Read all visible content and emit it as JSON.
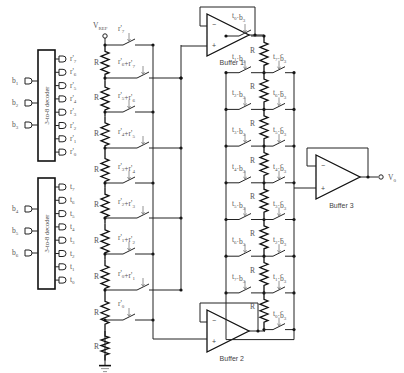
{
  "diagram": {
    "type": "DAC circuit schematic",
    "vref_label": "V",
    "vref_sub": "REF",
    "output_label": "V",
    "output_sub": "0",
    "resistor_label": "R",
    "decoders": [
      {
        "label": "3-to-8 decoder",
        "inputs": [
          "b1",
          "b2",
          "b3"
        ],
        "outputs": [
          "r'7",
          "r'6",
          "r'5",
          "r'4",
          "r'3",
          "r'2",
          "r'1",
          "r'0"
        ]
      },
      {
        "label": "3-to-8 decoder",
        "inputs": [
          "b4",
          "b5",
          "b6"
        ],
        "outputs": [
          "t7",
          "t6",
          "t5",
          "t4",
          "t3",
          "t2",
          "t1",
          "t0"
        ]
      }
    ],
    "buffers": [
      "Buffer 1",
      "Buffer 2",
      "Buffer 3"
    ],
    "left_ladder_switches": [
      "r'7",
      "r'6+r'7",
      "r'5+r'6",
      "r'4+r'5",
      "r'3+r'4",
      "r'2+r'3",
      "r'1+r'2",
      "r'0+r'1",
      "r'0"
    ],
    "right_ladder_left_switches": [
      "t0·b3",
      "t1·b3",
      "t2·b3",
      "t3·b3",
      "t4·b3",
      "t5·b3",
      "t6·b3",
      "t7·b3"
    ],
    "right_ladder_right_switches": [
      "t7·b̄3",
      "t6·b̄3",
      "t5·b̄3",
      "t4·b̄3",
      "t3·b̄3",
      "t2·b̄3",
      "t1·b̄3",
      "t0·b̄3"
    ]
  }
}
